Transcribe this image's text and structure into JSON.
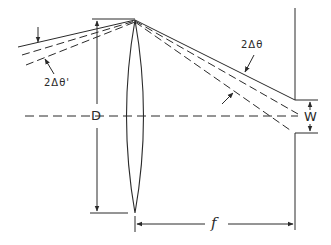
{
  "diagram": {
    "type": "optics-lens-focal-plane",
    "colors": {
      "stroke": "#2a2a2a",
      "background": "#ffffff"
    },
    "labels": {
      "incoming_angle": "2Δθ'",
      "outgoing_angle": "2Δθ",
      "aperture": "D",
      "focal_length": "f",
      "slit_width": "W"
    },
    "elements": [
      "biconvex-lens",
      "optical-axis",
      "focal-plane-screen",
      "incident-ray-bundle",
      "refracted-ray-bundle",
      "aperture-dimension-D",
      "focal-length-dimension-f",
      "slit-width-dimension-W"
    ]
  }
}
